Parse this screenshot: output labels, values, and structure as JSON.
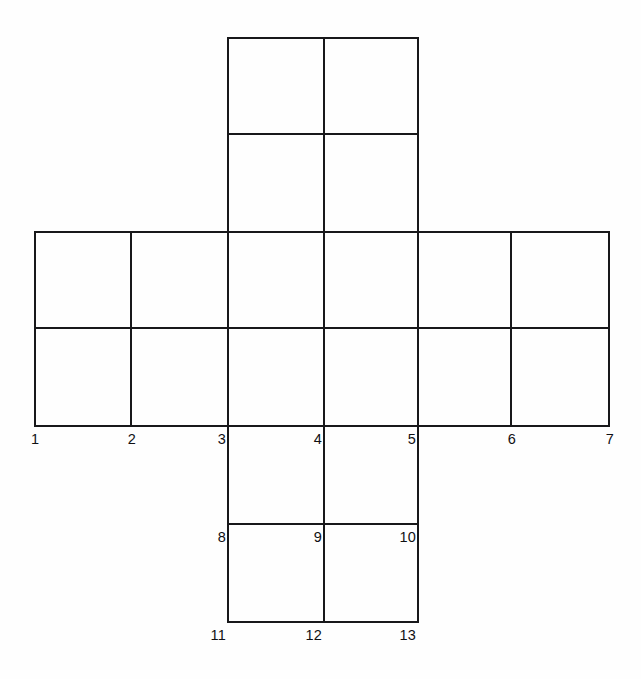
{
  "figure": {
    "background_color": "#fefefe",
    "line_color": "#18181a",
    "label_color": "#101013",
    "canvas": {
      "width": 641,
      "height": 679
    }
  },
  "grid": {
    "columns_x": [
      35,
      131,
      228,
      324,
      418,
      511,
      609
    ],
    "rows_y": [
      38,
      134,
      232,
      328,
      426,
      524,
      622
    ],
    "cell_width": 96,
    "cell_height": 97,
    "shape": "cross",
    "arms": {
      "top": {
        "x_from": 228,
        "x_to": 418,
        "y_from": 38,
        "y_to": 232,
        "cells": "2x2"
      },
      "middle": {
        "x_from": 35,
        "x_to": 609,
        "y_from": 232,
        "y_to": 426,
        "cells": "6x2"
      },
      "bottom": {
        "x_from": 228,
        "x_to": 418,
        "y_from": 426,
        "y_to": 622,
        "cells": "2x2"
      }
    }
  },
  "segments": {
    "horizontal": [
      {
        "name": "top-edge",
        "x1": 228,
        "x2": 418,
        "y": 38
      },
      {
        "name": "top-arm-midline",
        "x1": 228,
        "x2": 418,
        "y": 134
      },
      {
        "name": "band-top-edge",
        "x1": 35,
        "x2": 609,
        "y": 232
      },
      {
        "name": "band-midline",
        "x1": 35,
        "x2": 609,
        "y": 328
      },
      {
        "name": "band-bottom-edge",
        "x1": 35,
        "x2": 609,
        "y": 426
      },
      {
        "name": "bottom-arm-midline",
        "x1": 228,
        "x2": 418,
        "y": 524
      },
      {
        "name": "bottom-edge",
        "x1": 228,
        "x2": 418,
        "y": 622
      }
    ],
    "vertical": [
      {
        "name": "col-1",
        "x": 35,
        "y1": 232,
        "y2": 426
      },
      {
        "name": "col-2",
        "x": 131,
        "y1": 232,
        "y2": 426
      },
      {
        "name": "col-3",
        "x": 228,
        "y1": 38,
        "y2": 622
      },
      {
        "name": "col-4",
        "x": 324,
        "y1": 38,
        "y2": 622
      },
      {
        "name": "col-5",
        "x": 418,
        "y1": 38,
        "y2": 622
      },
      {
        "name": "col-6",
        "x": 511,
        "y1": 232,
        "y2": 426
      },
      {
        "name": "col-7",
        "x": 609,
        "y1": 232,
        "y2": 426
      }
    ]
  },
  "labels": [
    {
      "id": "label-1",
      "text": "1",
      "x": 31,
      "y": 432,
      "anchor": "left"
    },
    {
      "id": "label-2",
      "text": "2",
      "x": 136,
      "y": 432,
      "anchor": "right"
    },
    {
      "id": "label-3",
      "text": "3",
      "x": 226,
      "y": 432,
      "anchor": "right"
    },
    {
      "id": "label-4",
      "text": "4",
      "x": 322,
      "y": 432,
      "anchor": "right"
    },
    {
      "id": "label-5",
      "text": "5",
      "x": 416,
      "y": 432,
      "anchor": "right"
    },
    {
      "id": "label-6",
      "text": "6",
      "x": 516,
      "y": 432,
      "anchor": "right"
    },
    {
      "id": "label-7",
      "text": "7",
      "x": 614,
      "y": 432,
      "anchor": "right"
    },
    {
      "id": "label-8",
      "text": "8",
      "x": 226,
      "y": 530,
      "anchor": "right"
    },
    {
      "id": "label-9",
      "text": "9",
      "x": 322,
      "y": 530,
      "anchor": "right"
    },
    {
      "id": "label-10",
      "text": "10",
      "x": 416,
      "y": 530,
      "anchor": "right"
    },
    {
      "id": "label-11",
      "text": "11",
      "x": 226,
      "y": 628,
      "anchor": "right"
    },
    {
      "id": "label-12",
      "text": "12",
      "x": 322,
      "y": 628,
      "anchor": "right"
    },
    {
      "id": "label-13",
      "text": "13",
      "x": 416,
      "y": 628,
      "anchor": "right"
    }
  ]
}
